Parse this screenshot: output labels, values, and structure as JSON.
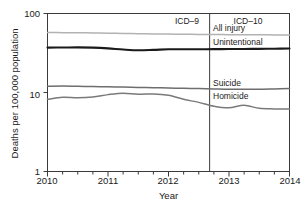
{
  "chart_data": {
    "type": "line",
    "title": "",
    "xlabel": "Year",
    "ylabel": "Deaths per 100,000 population",
    "yscale": "log",
    "ylim": [
      1,
      100
    ],
    "xlim": [
      2010,
      2014
    ],
    "ytick_labels": [
      "100",
      "10",
      "1"
    ],
    "ytick_values": [
      100,
      10,
      1
    ],
    "xtick_labels": [
      "2010",
      "2011",
      "2012",
      "2013",
      "2014"
    ],
    "xtick_values": [
      2010,
      2011,
      2012,
      2013,
      2014
    ],
    "minor_xticks_per_year": 4,
    "grid": false,
    "legend": "inline-right-labels",
    "annotations": [
      {
        "text": "ICD–9",
        "x": 2011.55,
        "y_px": 20,
        "align": "center"
      },
      {
        "text": "ICD–10",
        "x": 2013.25,
        "y_px": 20,
        "align": "center"
      }
    ],
    "vertical_divider": {
      "x": 2012.68,
      "label": "ICD revision change"
    },
    "series": [
      {
        "name": "All injury",
        "color": "#b2b2b2",
        "label_y_px": 27,
        "x": [
          2010.0,
          2010.25,
          2010.5,
          2010.75,
          2011.0,
          2011.25,
          2011.5,
          2011.75,
          2012.0,
          2012.25,
          2012.5,
          2012.75,
          2013.0,
          2013.25,
          2013.5,
          2013.75,
          2014.0
        ],
        "values": [
          57.5,
          57.2,
          57.0,
          56.8,
          56.4,
          56.0,
          55.6,
          55.2,
          54.9,
          54.6,
          54.4,
          54.2,
          54.0,
          53.9,
          53.8,
          53.6,
          53.4
        ]
      },
      {
        "name": "Unintentional",
        "color": "#1a1a1a",
        "label_y_px": 41,
        "x": [
          2010.0,
          2010.25,
          2010.5,
          2010.75,
          2011.0,
          2011.25,
          2011.5,
          2011.75,
          2012.0,
          2012.25,
          2012.5,
          2012.75,
          2013.0,
          2013.25,
          2013.5,
          2013.75,
          2014.0
        ],
        "values": [
          37.0,
          37.1,
          37.3,
          37.0,
          36.2,
          35.0,
          34.2,
          34.6,
          35.2,
          35.3,
          35.3,
          35.4,
          35.5,
          35.6,
          35.7,
          35.8,
          36.0
        ]
      },
      {
        "name": "Suicide",
        "color": "#6e6e6e",
        "label_y_px": 82,
        "x": [
          2010.0,
          2010.25,
          2010.5,
          2010.75,
          2011.0,
          2011.25,
          2011.5,
          2011.75,
          2012.0,
          2012.25,
          2012.5,
          2012.75,
          2013.0,
          2013.25,
          2013.5,
          2013.75,
          2014.0
        ],
        "values": [
          12.0,
          12.1,
          12.0,
          11.9,
          11.8,
          11.7,
          11.6,
          11.5,
          11.4,
          11.3,
          11.2,
          11.1,
          11.0,
          11.0,
          11.0,
          11.1,
          11.2
        ]
      },
      {
        "name": "Homicide",
        "color": "#7a7a7a",
        "label_y_px": 95,
        "x": [
          2010.0,
          2010.25,
          2010.5,
          2010.75,
          2011.0,
          2011.25,
          2011.5,
          2011.75,
          2012.0,
          2012.25,
          2012.5,
          2012.75,
          2013.0,
          2013.25,
          2013.5,
          2013.75,
          2014.0
        ],
        "values": [
          8.2,
          8.7,
          8.6,
          8.8,
          9.4,
          9.8,
          9.5,
          9.6,
          9.2,
          8.2,
          7.5,
          6.7,
          6.4,
          6.9,
          6.3,
          6.2,
          6.2
        ]
      }
    ]
  },
  "labels": {
    "ytitle": "Deaths per 100,000 population",
    "xtitle": "Year",
    "y_100": "100",
    "y_10": "10",
    "y_1": "1",
    "x_2010": "2010",
    "x_2011": "2011",
    "x_2012": "2012",
    "x_2013": "2013",
    "x_2014": "2014",
    "icd9": "ICD–9",
    "icd10": "ICD–10",
    "s_all_injury": "All injury",
    "s_unintentional": "Unintentional",
    "s_suicide": "Suicide",
    "s_homicide": "Homicide"
  }
}
